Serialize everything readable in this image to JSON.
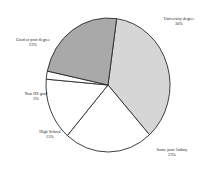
{
  "chart_data": {
    "type": "pie",
    "title": "",
    "subtitle": "",
    "xlabel": "",
    "ylabel": "",
    "legend_position": "none",
    "grid": false,
    "labels_outside": true,
    "categories": [
      "University degree",
      "Some post 2ndary",
      "High School",
      "Non HS grad",
      "Grad or prof degree"
    ],
    "values": [
      36,
      23,
      15,
      2,
      22
    ],
    "value_labels": [
      "36%",
      "23%",
      "15%",
      "2%",
      "22%"
    ],
    "colors": [
      "#d6d6d6",
      "#ffffff",
      "#ffffff",
      "#ffffff",
      "#a9a9a9"
    ],
    "slices": [
      {
        "name": "University degree",
        "value": 36,
        "value_label": "36%",
        "color": "#d6d6d6",
        "start_angle": 8,
        "end_angle": 138
      },
      {
        "name": "Some post 2ndary",
        "value": 23,
        "value_label": "23%",
        "color": "#ffffff",
        "start_angle": 138,
        "end_angle": 221
      },
      {
        "name": "High School",
        "value": 15,
        "value_label": "15%",
        "color": "#ffffff",
        "start_angle": 221,
        "end_angle": 275
      },
      {
        "name": "Non HS grad",
        "value": 2,
        "value_label": "2%",
        "color": "#ffffff",
        "start_angle": 275,
        "end_angle": 282
      },
      {
        "name": "Grad or prof degree",
        "value": 22,
        "value_label": "22%",
        "color": "#a9a9a9",
        "start_angle": 282,
        "end_angle": 368
      }
    ],
    "outline_color": "#2a2a2a",
    "background": "#ffffff"
  }
}
